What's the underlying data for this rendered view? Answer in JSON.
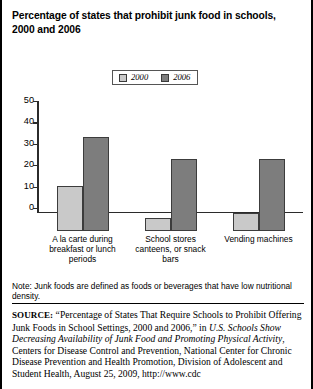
{
  "chart_data": {
    "type": "bar",
    "title": "Percentage of states that prohibit junk food in schools, 2000 and 2006",
    "xlabel": "",
    "ylabel": "",
    "ylim": [
      0,
      50
    ],
    "yticks": [
      0,
      10,
      20,
      30,
      40,
      50
    ],
    "grid": false,
    "legend_position": "top-center",
    "categories": [
      "A la carte during breakfast or lunch periods",
      "School stores canteens, or snack bars",
      "Vending machines"
    ],
    "series": [
      {
        "name": "2000",
        "color": "#c9c9c9",
        "values": [
          20,
          6,
          8
        ]
      },
      {
        "name": "2006",
        "color": "#7d7d7d",
        "values": [
          42,
          32,
          32
        ]
      }
    ]
  },
  "title": {
    "text": "Percentage of states that prohibit junk food in schools, 2000 and 2006"
  },
  "legend": {
    "items": [
      {
        "label": "2000",
        "color": "#c9c9c9"
      },
      {
        "label": "2006",
        "color": "#7d7d7d"
      }
    ]
  },
  "axis": {
    "y_tick_labels": [
      "50",
      "40",
      "30",
      "20",
      "10",
      "0"
    ]
  },
  "categories": [
    {
      "label": "A la carte during breakfast or lunch periods"
    },
    {
      "label": "School stores canteens, or snack bars"
    },
    {
      "label": "Vending machines"
    }
  ],
  "note": {
    "text": "Note: Junk foods are defined as foods or beverages that have low nutritional density."
  },
  "source": {
    "label": "SOURCE:",
    "part1": " “Percentage of States That Require Schools to Prohibit Offering Junk Foods in School Settings, 2000 and 2006,” in ",
    "italic1": "U.S. Schools Show Decreasing Availability of Junk Food and Promoting Physical Activity",
    "part2": ", Centers for Disease Control and Prevention, National Center for Chronic Disease Prevention and Health Promotion, Division of Adolescent and Student Health, August 25, 2009, http://www.cdc"
  }
}
